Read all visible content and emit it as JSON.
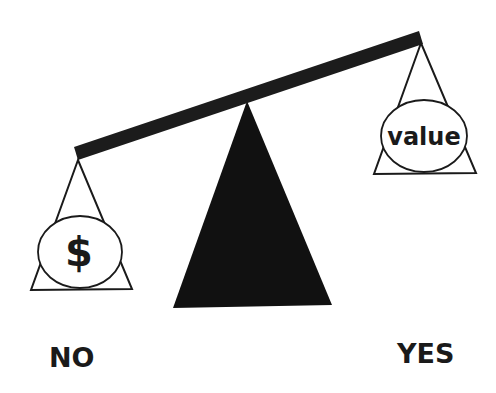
{
  "diagram": {
    "type": "balance-scale",
    "left_pan": {
      "symbol": "$",
      "icon": "dollar-sign-icon",
      "side_label": "NO"
    },
    "right_pan": {
      "symbol": "value",
      "side_label": "YES"
    },
    "colors": {
      "ink": "#1a1a1a",
      "fulcrum": "#111111",
      "background": "#ffffff",
      "pan_fill": "#ffffff"
    }
  }
}
